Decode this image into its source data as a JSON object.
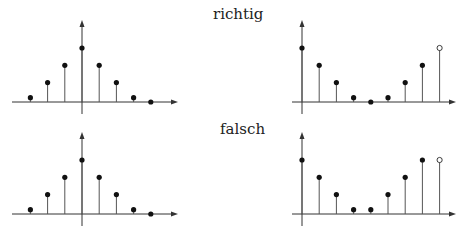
{
  "labels": {
    "top": "richtig",
    "bottom": "falsch"
  },
  "colors": {
    "stroke": "#333333",
    "dot": "#111111"
  },
  "chart_data": [
    {
      "type": "stem",
      "name": "richtig-left",
      "title": "richtig",
      "description": "symmetric decaying sequence centered at n=0",
      "n": [
        -3,
        -2,
        -1,
        0,
        1,
        2,
        3,
        4
      ],
      "values": [
        0.08,
        0.36,
        0.68,
        1.0,
        0.68,
        0.36,
        0.08,
        0.0
      ]
    },
    {
      "type": "stem",
      "name": "richtig-right",
      "title": "richtig",
      "description": "periodic-shifted sequence, last sample open circle",
      "n": [
        0,
        1,
        2,
        3,
        4,
        5,
        6,
        7,
        8
      ],
      "values": [
        1.0,
        0.68,
        0.36,
        0.08,
        0.0,
        0.08,
        0.36,
        0.68,
        1.0
      ],
      "open_markers": [
        8
      ]
    },
    {
      "type": "stem",
      "name": "falsch-left",
      "title": "falsch",
      "n": [
        -3,
        -2,
        -1,
        0,
        1,
        2,
        3,
        4
      ],
      "values": [
        0.08,
        0.36,
        0.68,
        1.0,
        0.68,
        0.36,
        0.08,
        0.0
      ]
    },
    {
      "type": "stem",
      "name": "falsch-right",
      "title": "falsch",
      "n": [
        0,
        1,
        2,
        3,
        4,
        5,
        6,
        7,
        8
      ],
      "values": [
        1.0,
        0.68,
        0.36,
        0.08,
        0.08,
        0.36,
        0.68,
        1.0,
        1.0
      ],
      "open_markers": [
        8
      ]
    }
  ]
}
